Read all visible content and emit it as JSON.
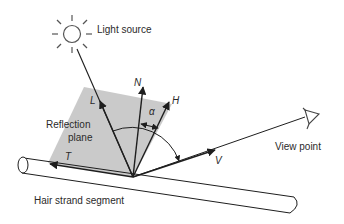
{
  "labels": {
    "light_source": "Light source",
    "reflection_plane_line1": "Reflection",
    "reflection_plane_line2": "plane",
    "view_point": "View point",
    "hair_strand": "Hair strand segment"
  },
  "vectors": {
    "L": "L",
    "N": "N",
    "H": "H",
    "V": "V",
    "T": "T"
  },
  "angle_label": "α",
  "colors": {
    "line": "#1e1e1e",
    "plane_fill": "#c4c4c4",
    "text": "#2a2a2a",
    "sun": "#555555"
  }
}
